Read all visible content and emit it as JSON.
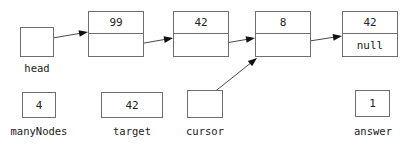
{
  "diagram": {
    "stroke_color": "#6e6e6e",
    "arrow_color": "#4a4a4a",
    "text_color": "#222222",
    "background": "#ffffff"
  },
  "nodes": [
    {
      "id": "node-1",
      "data": "99",
      "link": "",
      "x": 88,
      "y": 11,
      "w": 56,
      "h": 46
    },
    {
      "id": "node-2",
      "data": "42",
      "link": "",
      "x": 173,
      "y": 11,
      "w": 56,
      "h": 46
    },
    {
      "id": "node-3",
      "data": "8",
      "link": "",
      "x": 255,
      "y": 11,
      "w": 56,
      "h": 46
    },
    {
      "id": "node-4",
      "data": "42",
      "link": "null",
      "x": 342,
      "y": 11,
      "w": 56,
      "h": 46
    }
  ],
  "variables": [
    {
      "id": "head",
      "label": "head",
      "value": "",
      "x": 20,
      "y": 27,
      "w": 34,
      "h": 30,
      "label_x": 20,
      "label_y": 63,
      "label_w": 34
    },
    {
      "id": "manyNodes",
      "label": "manyNodes",
      "value": "4",
      "x": 22,
      "y": 92,
      "w": 34,
      "h": 26,
      "label_x": 2,
      "label_y": 126,
      "label_w": 74
    },
    {
      "id": "target",
      "label": "target",
      "value": "42",
      "x": 101,
      "y": 92,
      "w": 62,
      "h": 26,
      "label_x": 101,
      "label_y": 126,
      "label_w": 62
    },
    {
      "id": "cursor",
      "label": "cursor",
      "value": "",
      "x": 187,
      "y": 90,
      "w": 36,
      "h": 28,
      "label_x": 186,
      "label_y": 126,
      "label_w": 38
    },
    {
      "id": "answer",
      "label": "answer",
      "value": "1",
      "x": 355,
      "y": 90,
      "w": 35,
      "h": 27,
      "label_x": 348,
      "label_y": 126,
      "label_w": 50
    }
  ],
  "arrows": [
    {
      "id": "head-to-node1",
      "x1": 35,
      "y1": 41,
      "x2": 88,
      "y2": 32
    },
    {
      "id": "node1-to-node2",
      "x1": 110,
      "y1": 49,
      "x2": 173,
      "y2": 38
    },
    {
      "id": "node2-to-node3",
      "x1": 196,
      "y1": 48,
      "x2": 255,
      "y2": 38
    },
    {
      "id": "node3-to-node4",
      "x1": 277,
      "y1": 46,
      "x2": 342,
      "y2": 36
    },
    {
      "id": "cursor-to-node3",
      "x1": 203,
      "y1": 101,
      "x2": 257,
      "y2": 58
    }
  ]
}
